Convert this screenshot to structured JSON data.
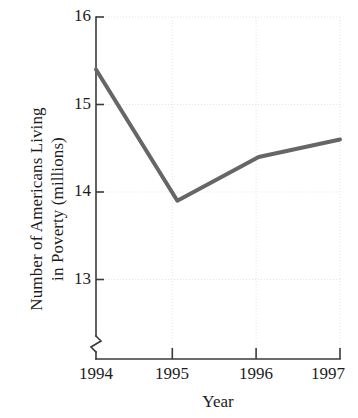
{
  "chart_data": {
    "type": "line",
    "title": "",
    "xlabel": "Year",
    "ylabel": "Number of Americans Living in Poverty (millions)",
    "ylabel_lines": [
      "Number of Americans Living",
      "in Poverty (millions)"
    ],
    "categories": [
      "1994",
      "1995",
      "1996",
      "1997"
    ],
    "x": [
      1994,
      1995,
      1996,
      1997
    ],
    "values": [
      15.4,
      13.9,
      14.4,
      14.6
    ],
    "series": [
      {
        "name": "Number of Americans Living in Poverty (millions)",
        "values": [
          15.4,
          13.9,
          14.4,
          14.6
        ]
      }
    ],
    "xtick_labels": [
      "1994",
      "1995",
      "1996",
      "1997"
    ],
    "ytick_labels": [
      "13",
      "14",
      "15",
      "16"
    ],
    "yticks": [
      13,
      14,
      15,
      16
    ],
    "ylim": [
      12.6,
      16
    ],
    "xlim": [
      1994,
      1997
    ],
    "axis_break": true,
    "axis_break_symbol": "y-axis-break",
    "grid": "dotted",
    "legend": "none",
    "line_color": "#666666",
    "axis_color": "#3a3a3a",
    "grid_color": "#e2e2e2",
    "text_color": "#1c1c1c",
    "line_width": 4
  },
  "axes": {
    "y_tick_labels": [
      {
        "text": "16",
        "value": 16
      },
      {
        "text": "15",
        "value": 15
      },
      {
        "text": "14",
        "value": 14
      },
      {
        "text": "13",
        "value": 13
      }
    ],
    "x_tick_labels": [
      {
        "text": "1994",
        "value": 1994
      },
      {
        "text": "1995",
        "value": 1995
      },
      {
        "text": "1996",
        "value": 1996
      },
      {
        "text": "1997",
        "value": 1997
      }
    ]
  }
}
